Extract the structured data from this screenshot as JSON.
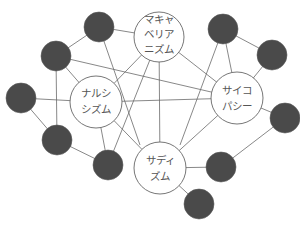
{
  "diagram": {
    "main_nodes": [
      {
        "id": "mach",
        "lines": [
          "マキャ",
          "ベリア",
          "ニズム"
        ],
        "cx": 159,
        "cy": 37,
        "r": 26
      },
      {
        "id": "narc",
        "lines": [
          "ナルシ",
          "シズム"
        ],
        "cx": 96,
        "cy": 102,
        "r": 26
      },
      {
        "id": "psych",
        "lines": [
          "サイコ",
          "パシー"
        ],
        "cx": 237,
        "cy": 98,
        "r": 26
      },
      {
        "id": "sad",
        "lines": [
          "サディ",
          "ズム"
        ],
        "cx": 160,
        "cy": 168,
        "r": 26
      }
    ],
    "dark_nodes": [
      {
        "id": "d1",
        "cx": 99,
        "cy": 27
      },
      {
        "id": "d2",
        "cx": 56,
        "cy": 56
      },
      {
        "id": "d3",
        "cx": 223,
        "cy": 29
      },
      {
        "id": "d4",
        "cx": 272,
        "cy": 55
      },
      {
        "id": "d5",
        "cx": 21,
        "cy": 98
      },
      {
        "id": "d6",
        "cx": 57,
        "cy": 140
      },
      {
        "id": "d7",
        "cx": 108,
        "cy": 165
      },
      {
        "id": "d8",
        "cx": 285,
        "cy": 118
      },
      {
        "id": "d9",
        "cx": 221,
        "cy": 167
      },
      {
        "id": "d10",
        "cx": 199,
        "cy": 204
      }
    ],
    "colors": {
      "dark_node": "#4a4a4a",
      "edge": "#6a6a6a",
      "main_stroke": "#666666"
    }
  }
}
